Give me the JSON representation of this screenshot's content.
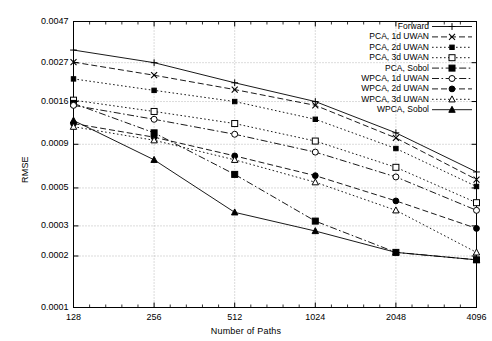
{
  "chart_data": {
    "type": "line",
    "title": "",
    "xlabel": "Number of Paths",
    "ylabel": "RMSE",
    "xscale": "log",
    "yscale": "log",
    "grid": true,
    "legend_position": "upper-right-inside",
    "x": [
      128,
      256,
      512,
      1024,
      2048,
      4096
    ],
    "xtick_labels": [
      "128",
      "256",
      "512",
      "1024",
      "2048",
      "4096"
    ],
    "ytick_values": [
      0.0047,
      0.0027,
      0.0016,
      0.0009,
      0.0005,
      0.0003,
      0.0002,
      0.0001
    ],
    "ytick_labels": [
      "0.0047",
      "0.0027",
      "0.0016",
      "0.0009",
      "0.0005",
      "0.0003",
      "0.0002",
      "0.0001"
    ],
    "xlim": [
      128,
      4096
    ],
    "ylim": [
      0.0001,
      0.0047
    ],
    "series": [
      {
        "name": "Forward",
        "marker": "plus",
        "dash": "solid",
        "values": [
          0.0032,
          0.0027,
          0.00206,
          0.0016,
          0.00105,
          0.00062
        ]
      },
      {
        "name": "PCA, 1d UWAN",
        "marker": "cross",
        "dash": "dashed",
        "values": [
          0.00272,
          0.00228,
          0.00188,
          0.00152,
          0.00098,
          0.00056
        ]
      },
      {
        "name": "PCA, 2d UWAN",
        "marker": "square-small",
        "dash": "dotted",
        "values": [
          0.00217,
          0.00186,
          0.0016,
          0.00126,
          0.00085,
          0.00051
        ]
      },
      {
        "name": "PCA, 3d UWAN",
        "marker": "square-open",
        "dash": "dotted",
        "values": [
          0.00163,
          0.0014,
          0.00119,
          0.00094,
          0.00066,
          0.00041
        ]
      },
      {
        "name": "PCA, Sobol",
        "marker": "square-filled",
        "dash": "dashdot",
        "values": [
          0.00156,
          0.00105,
          0.0006,
          0.00032,
          0.00021,
          0.00019
        ]
      },
      {
        "name": "WPCA, 1d UWAN",
        "marker": "circle-open",
        "dash": "dashdot",
        "values": [
          0.00152,
          0.00126,
          0.00103,
          0.00081,
          0.00058,
          0.00037
        ]
      },
      {
        "name": "WPCA, 2d UWAN",
        "marker": "circle-filled",
        "dash": "dashed",
        "values": [
          0.00119,
          0.00099,
          0.00077,
          0.00059,
          0.00042,
          0.00029
        ]
      },
      {
        "name": "WPCA, 3d UWAN",
        "marker": "triangle-open",
        "dash": "dotted",
        "values": [
          0.00114,
          0.00095,
          0.00073,
          0.00054,
          0.00037,
          0.00021
        ]
      },
      {
        "name": "WPCA, Sobol",
        "marker": "triangle-filled",
        "dash": "solid",
        "values": [
          0.00124,
          0.00073,
          0.00036,
          0.00028,
          0.00021,
          0.00019
        ]
      }
    ]
  },
  "axes": {
    "y_title": "RMSE",
    "x_title": "Number of Paths"
  }
}
